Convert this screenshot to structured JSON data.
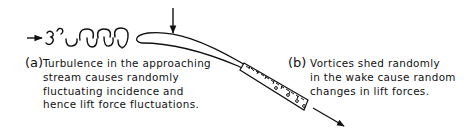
{
  "figure": {
    "type": "diagram",
    "panels": [
      {
        "id": "a",
        "label": "(a)",
        "lines": [
          "Turbulence  in the approaching",
          "stream causes randomly",
          "fluctuating incidence and",
          "hence lift force fluctuations."
        ]
      },
      {
        "id": "b",
        "label": "(b)",
        "lines": [
          "Vortices shed randomly",
          "in the wake cause random",
          "changes in lift forces."
        ]
      }
    ],
    "elements": {
      "incoming_flow_arrow": "arrow-right",
      "turbulent_eddies": "eddy-squiggles",
      "airfoil": "airfoil-section",
      "lift_arrow": "arrow-down",
      "wake": "hatched-wake-with-vortices",
      "outgoing_flow_arrow": "arrow-down-right"
    },
    "colors": {
      "ink": "#111111",
      "background": "#ffffff"
    }
  }
}
